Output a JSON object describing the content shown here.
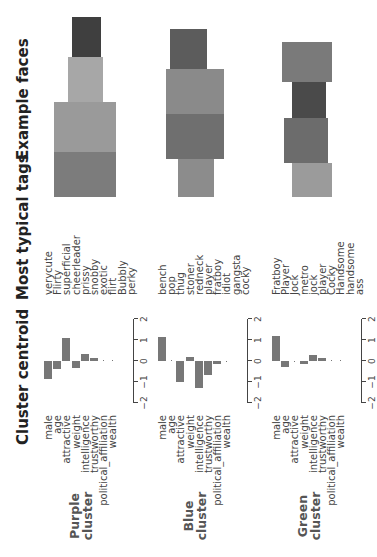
{
  "headers": {
    "centroid": "Cluster centroid",
    "tags": "Most typical tags",
    "faces": "Example faces"
  },
  "features": [
    "male",
    "age",
    "attractive",
    "weight",
    "intelligence",
    "trustworthy",
    "political_affiliation",
    "wealth"
  ],
  "axis_ticks": [
    "−2",
    "−1",
    "0",
    "1",
    "2"
  ],
  "clusters": [
    {
      "label_line1": "Purple",
      "label_line2": "cluster",
      "tags": [
        "verycute",
        "Flirty",
        "superficial",
        "cheerleader",
        "prissy",
        "snobby",
        "exotic",
        "flirt",
        "Bubbly",
        "perky"
      ],
      "face_count": 4
    },
    {
      "label_line1": "Blue",
      "label_line2": "cluster",
      "tags": [
        "bench",
        "pop",
        "thug",
        "stoner",
        "redneck",
        "player",
        "fratboy",
        "idiot",
        "gangsta",
        "cocky"
      ],
      "face_count": 4
    },
    {
      "label_line1": "Green",
      "label_line2": "cluster",
      "tags": [
        "Fratboy",
        "Player",
        "Jock",
        "metro",
        "jock",
        "player",
        "Cocky",
        "Handsome",
        "handsome",
        "ass"
      ],
      "face_count": 4
    }
  ],
  "chart_data": [
    {
      "type": "bar",
      "title": "Purple cluster centroid",
      "orientation": "horizontal",
      "categories": [
        "male",
        "age",
        "attractive",
        "weight",
        "intelligence",
        "trustworthy",
        "political_affiliation",
        "wealth"
      ],
      "values": [
        -0.85,
        -0.4,
        1.1,
        -0.35,
        0.35,
        0.15,
        0.02,
        0.02
      ],
      "xlim": [
        -2,
        2
      ],
      "xticks": [
        -2,
        -1,
        0,
        1,
        2
      ],
      "grid": false
    },
    {
      "type": "bar",
      "title": "Blue cluster centroid",
      "orientation": "horizontal",
      "categories": [
        "male",
        "age",
        "attractive",
        "weight",
        "intelligence",
        "trustworthy",
        "political_affiliation",
        "wealth"
      ],
      "values": [
        1.15,
        0.0,
        -1.0,
        0.2,
        -1.3,
        -0.65,
        -0.15,
        -0.05
      ],
      "xlim": [
        -2,
        2
      ],
      "xticks": [
        -2,
        -1,
        0,
        1,
        2
      ],
      "grid": false
    },
    {
      "type": "bar",
      "title": "Green cluster centroid",
      "orientation": "horizontal",
      "categories": [
        "male",
        "age",
        "attractive",
        "weight",
        "intelligence",
        "trustworthy",
        "political_affiliation",
        "wealth"
      ],
      "values": [
        1.2,
        -0.3,
        -0.05,
        -0.12,
        0.3,
        0.12,
        0.03,
        0.02
      ],
      "xlim": [
        -2,
        2
      ],
      "xticks": [
        -2,
        -1,
        0,
        1,
        2
      ],
      "grid": false
    }
  ]
}
